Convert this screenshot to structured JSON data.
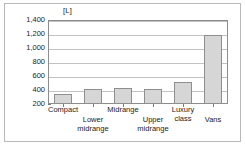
{
  "chart_data": {
    "type": "bar",
    "title": "",
    "subtitle": "",
    "xlabel": "",
    "ylabel": "[L]",
    "unit": "[L]",
    "categories": [
      "Compact",
      "Lower midrange",
      "Midrange",
      "Upper midrange",
      "Luxury class",
      "Vans"
    ],
    "category_lines": [
      [
        "Compact"
      ],
      [
        "Lower",
        "midrange"
      ],
      [
        "Midrange"
      ],
      [
        "Upper",
        "midrange"
      ],
      [
        "Luxury",
        "class"
      ],
      [
        "Vans"
      ]
    ],
    "values": [
      350,
      410,
      430,
      420,
      510,
      1190
    ],
    "ylim": [
      200,
      1400
    ],
    "yticks": [
      200,
      400,
      600,
      800,
      1000,
      1200,
      1400
    ],
    "ytick_labels": [
      "200",
      "400",
      "600",
      "800",
      "1,000",
      "1,200",
      "1,400"
    ],
    "grid": true,
    "legend": false,
    "legend_position": "none",
    "bar_color": "#d6d6d6",
    "bar_edge_color": "#8f8f8f",
    "grid_color": "#c2c2c2",
    "axis_color": "#8c8c8c",
    "text_color": "#1a1a1a",
    "background": "#ffffff"
  }
}
